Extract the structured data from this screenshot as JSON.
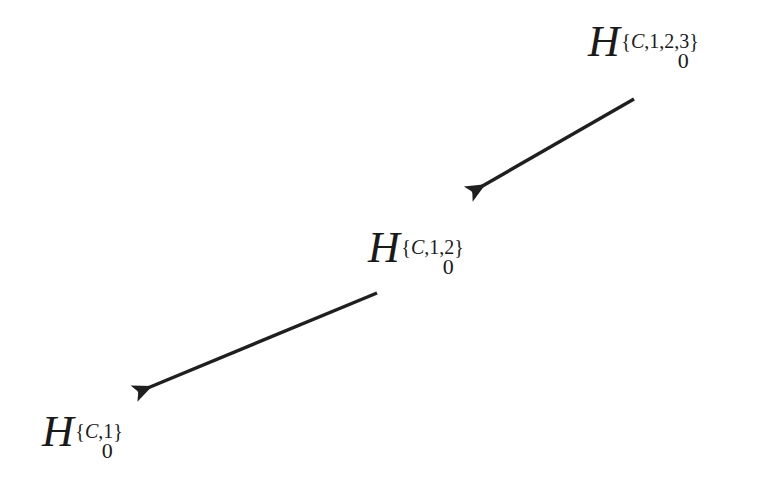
{
  "figure": {
    "background_color": "#ffffff",
    "stroke_color": "#1f1f1f"
  },
  "nodes": [
    {
      "id": "H0-C123",
      "base": "H",
      "subscript": "0",
      "superscript_open": "{",
      "superscript_set_variable": "C",
      "superscript_rest": ",1,2,3",
      "superscript_close": "}",
      "full_label": "H_0^{C,1,2,3}",
      "x": 588,
      "y": 20
    },
    {
      "id": "H0-C12",
      "base": "H",
      "subscript": "0",
      "superscript_open": "{",
      "superscript_set_variable": "C",
      "superscript_rest": ",1,2",
      "superscript_close": "}",
      "full_label": "H_0^{C,1,2}",
      "x": 368,
      "y": 226
    },
    {
      "id": "H0-C1",
      "base": "H",
      "subscript": "0",
      "superscript_open": "{",
      "superscript_set_variable": "C",
      "superscript_rest": ",1",
      "superscript_close": "}",
      "full_label": "H_0^{C,1}",
      "x": 42,
      "y": 410
    }
  ],
  "arrows": [
    {
      "id": "arrow-top",
      "from_node": "H0-C123",
      "to_node": "H0-C12",
      "x1": 634,
      "y1": 99,
      "x2": 472,
      "y2": 192,
      "stroke_width": 3.4,
      "color": "#1f1f1f"
    },
    {
      "id": "arrow-bottom",
      "from_node": "H0-C12",
      "to_node": "H0-C1",
      "x1": 377,
      "y1": 293,
      "x2": 138,
      "y2": 392,
      "stroke_width": 3.4,
      "color": "#1f1f1f"
    }
  ]
}
